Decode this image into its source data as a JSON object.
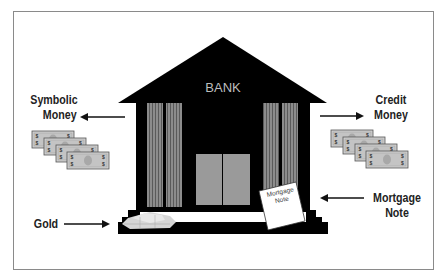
{
  "diagram": {
    "building_label": "BANK",
    "labels": {
      "symbolic_money": [
        "Symbolic",
        "Money"
      ],
      "credit_money": [
        "Credit",
        "Money"
      ],
      "gold": "Gold",
      "mortgage_note": [
        "Mortgage",
        "Note"
      ]
    },
    "mortgage_document_text": [
      "Mortgage",
      "Note"
    ],
    "arrows": [
      {
        "from": "bank",
        "to": "Symbolic Money",
        "direction": "left"
      },
      {
        "from": "bank",
        "to": "Credit Money",
        "direction": "right"
      },
      {
        "from": "Gold",
        "to": "bank",
        "direction": "right"
      },
      {
        "from": "Mortgage Note",
        "to": "bank",
        "direction": "left"
      }
    ],
    "icons": [
      "bank-building-icon",
      "banknote-stack-icon",
      "gold-bars-icon",
      "mortgage-document-icon"
    ],
    "colors": {
      "building": "#000000",
      "columns": "#8c8c8c",
      "doors": "#9a9a9a",
      "bank_text": "#bdbdbd",
      "bills": "#c8c8c8",
      "frame": "#8a8a8a"
    }
  }
}
